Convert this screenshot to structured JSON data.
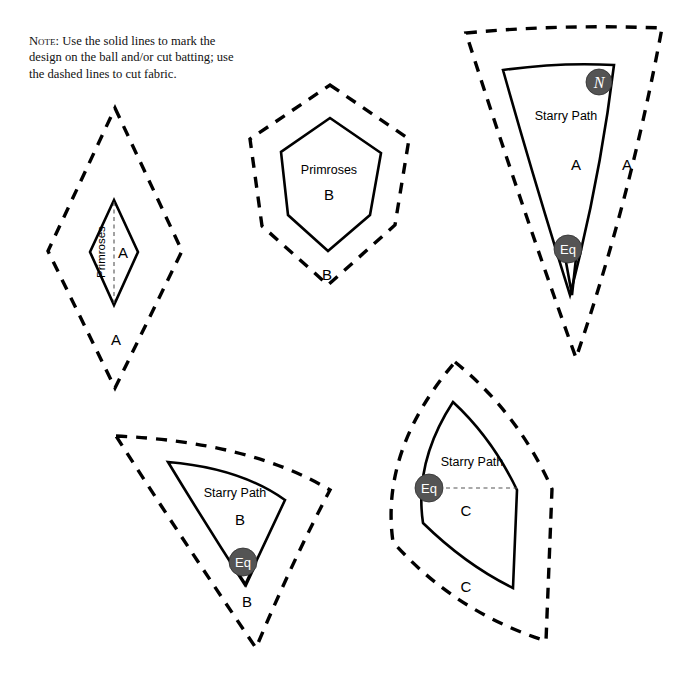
{
  "note": {
    "lead": "Note:",
    "text": " Use the solid lines to mark the design on the ball and/or cut batting; use the dashed lines to cut fabric.",
    "full": "Note: Use the solid lines to mark the design on the ball and/or cut batting; use the dashed lines to cut fabric."
  },
  "colors": {
    "ink": "#000000",
    "badge_fill": "#545454",
    "badge_text": "#ffffff",
    "fine_dash": "#555555",
    "background": "#ffffff"
  },
  "templates": [
    {
      "id": "primroses-a",
      "pattern_name": "Primroses",
      "piece_letter": "A",
      "inner_label": "A",
      "outer_label": "A",
      "name_rotated": true,
      "has_center_line": true,
      "badges": [],
      "solid_path": "M 114 200 L 138 252 L 114 305 L 90 252 Z",
      "dashed_path": "M 115 108 L 182 251 L 115 388 L 48 251 Z",
      "center_line": "M 114 202 L 114 303",
      "name_pos": {
        "x": 105,
        "y": 252
      },
      "inner_label_pos": {
        "x": 123,
        "y": 258
      },
      "outer_label_pos": {
        "x": 116,
        "y": 345
      }
    },
    {
      "id": "primroses-b",
      "pattern_name": "Primroses",
      "piece_letter": "B",
      "inner_label": "B",
      "outer_label": "B",
      "name_rotated": false,
      "has_center_line": false,
      "badges": [],
      "solid_path": "M 330 118 L 381 153 L 370 215 L 328 251 L 288 215 L 281 152 Z",
      "dashed_path": "M 330 85 L 409 139 L 395 225 L 328 285 L 262 226 L 250 139 Z",
      "name_pos": {
        "x": 329,
        "y": 174
      },
      "inner_label_pos": {
        "x": 329,
        "y": 200
      },
      "outer_label_pos": {
        "x": 327,
        "y": 280
      }
    },
    {
      "id": "starry-path-a",
      "pattern_name": "Starry Path",
      "piece_letter": "A",
      "inner_label": "A",
      "outer_label": "A",
      "name_rotated": false,
      "has_center_line": false,
      "badges": [
        {
          "label": "N",
          "style": "italic",
          "cx": 599,
          "cy": 82,
          "r": 13
        },
        {
          "label": "Eq",
          "style": "normal",
          "cx": 568,
          "cy": 249,
          "r": 14
        }
      ],
      "solid_path": "M 503 70 Q 560 62 614 65 Q 600 180 570 295 Q 534 180 503 70 Z",
      "solid_notch": "M 566 262 L 572 295 L 576 258",
      "dashed_path": "M 466 33 Q 560 24 662 28 Q 630 200 576 358 Q 518 196 466 33 Z",
      "name_pos": {
        "x": 566,
        "y": 120
      },
      "inner_label_pos": {
        "x": 576,
        "y": 170
      },
      "outer_label_pos": {
        "x": 627,
        "y": 170
      }
    },
    {
      "id": "starry-path-b",
      "pattern_name": "Starry Path",
      "piece_letter": "B",
      "inner_label": "B",
      "outer_label": "B",
      "name_rotated": false,
      "has_center_line": false,
      "badges": [
        {
          "label": "Eq",
          "style": "normal",
          "cx": 243,
          "cy": 562,
          "r": 14
        }
      ],
      "solid_path": "M 168 462 Q 240 468 285 500 Q 264 545 245 585 Q 205 523 168 462 Z",
      "solid_notch": "M 238 573 L 246 585 L 253 570",
      "dashed_path": "M 116 436 Q 250 442 330 490 Q 292 562 256 648 Q 184 542 116 436 Z",
      "name_pos": {
        "x": 235,
        "y": 497
      },
      "inner_label_pos": {
        "x": 240,
        "y": 525
      },
      "outer_label_pos": {
        "x": 247,
        "y": 607
      }
    },
    {
      "id": "starry-path-c",
      "pattern_name": "Starry Path",
      "piece_letter": "C",
      "inner_label": "C",
      "outer_label": "C",
      "name_rotated": false,
      "has_center_line": false,
      "badges": [
        {
          "label": "Eq",
          "style": "normal",
          "cx": 429,
          "cy": 488,
          "r": 14
        }
      ],
      "equator_line": "M 416 488 L 517 488",
      "solid_path": "M 453 402 Q 492 438 517 490 L 513 588 Q 466 565 423 523 Q 414 462 453 402 Z",
      "dashed_path": "M 455 362 Q 518 413 552 489 L 546 641 Q 455 612 393 542 Q 380 450 455 362 Z",
      "name_pos": {
        "x": 472,
        "y": 466
      },
      "inner_label_pos": {
        "x": 466,
        "y": 516
      },
      "outer_label_pos": {
        "x": 466,
        "y": 592
      }
    }
  ]
}
